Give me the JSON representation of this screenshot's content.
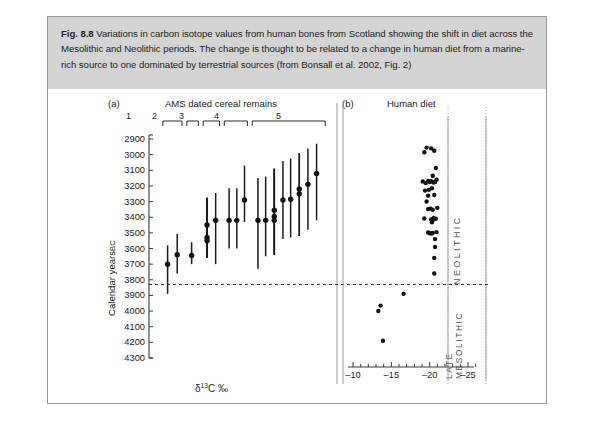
{
  "figure": {
    "number": "Fig. 8.8",
    "caption": "Variations in carbon isotope values from human bones from Scotland showing the shift in diet across the Mesolithic and Neolithic periods. The change is thought to be related to a change in human diet from a marine-rich source to one dominated by terrestrial sources (from Bonsall et al. 2002, Fig. 2)",
    "caption_background": "#d4d4d4",
    "border_color": "#9a9a9a"
  },
  "panel_a": {
    "tag": "(a)",
    "title": "AMS dated cereal remains",
    "group_labels": [
      "1",
      "2",
      "3",
      "4",
      "5"
    ]
  },
  "panel_b": {
    "tag": "(b)",
    "title": "Human diet",
    "period_upper": "NEOLITHIC",
    "period_lower_line1": "LATE",
    "period_lower_line2": "MESOLITHIC"
  },
  "axes": {
    "y_label": "Calendar years",
    "y_label_suffix": "BC",
    "y_ticks": [
      2900,
      3000,
      3100,
      3200,
      3300,
      3400,
      3500,
      3600,
      3700,
      3800,
      3900,
      4000,
      4100,
      4200,
      4300
    ],
    "y_min": 2900,
    "y_max": 4300,
    "x_label_html": "δ<sup>13</sup>C ‰",
    "x_label_plain": "δ13C ‰",
    "x_major_ticks": [
      -10,
      -15,
      -20,
      -25
    ],
    "x_min": -9,
    "x_max": -26,
    "boundary_value": 3830,
    "boundary_style": "dashed"
  },
  "chart_data": {
    "type": "scatter",
    "title": "Variations in carbon isotope values from human bones from Scotland",
    "panels": [
      {
        "id": "a",
        "type": "errorbar",
        "title": "AMS dated cereal remains",
        "xlabel": "",
        "ylabel": "Calendar years BC",
        "ylim": [
          4300,
          2900
        ],
        "grid": false,
        "groups": [
          {
            "label": "1",
            "x_start": 0.5,
            "x_end": 2.5
          },
          {
            "label": "2",
            "x_start": 3.0,
            "x_end": 4.2
          },
          {
            "label": "3",
            "x_start": 4.7,
            "x_end": 6.4
          },
          {
            "label": "4",
            "x_start": 6.9,
            "x_end": 9.3
          },
          {
            "label": "5",
            "x_start": 9.8,
            "x_end": 17.4
          }
        ],
        "points": [
          {
            "group": "1",
            "x": 1.0,
            "value": 3700,
            "low": 3890,
            "high": 3580
          },
          {
            "group": "1",
            "x": 2.0,
            "value": 3640,
            "low": 3760,
            "high": 3505
          },
          {
            "group": "2",
            "x": 3.5,
            "value": 3645,
            "low": 3700,
            "high": 3560
          },
          {
            "group": "3",
            "x": 5.1,
            "value": 3450,
            "low": 3660,
            "high": 3275
          },
          {
            "group": "3",
            "x": 5.1,
            "value": 3530,
            "low": 3660,
            "high": 3275
          },
          {
            "group": "3",
            "x": 5.1,
            "value": 3550,
            "low": 3660,
            "high": 3275
          },
          {
            "group": "3",
            "x": 6.0,
            "value": 3420,
            "low": 3700,
            "high": 3245
          },
          {
            "group": "4",
            "x": 7.4,
            "value": 3420,
            "low": 3600,
            "high": 3215
          },
          {
            "group": "4",
            "x": 8.2,
            "value": 3420,
            "low": 3600,
            "high": 3215
          },
          {
            "group": "4",
            "x": 9.0,
            "value": 3290,
            "low": 3430,
            "high": 3070
          },
          {
            "group": "5",
            "x": 10.4,
            "value": 3420,
            "low": 3730,
            "high": 3150
          },
          {
            "group": "5",
            "x": 11.2,
            "value": 3420,
            "low": 3650,
            "high": 3140
          },
          {
            "group": "5",
            "x": 12.1,
            "value": 3355,
            "low": 3640,
            "high": 3090
          },
          {
            "group": "5",
            "x": 12.1,
            "value": 3395,
            "low": 3640,
            "high": 3090
          },
          {
            "group": "5",
            "x": 12.1,
            "value": 3420,
            "low": 3640,
            "high": 3090
          },
          {
            "group": "5",
            "x": 13.0,
            "value": 3290,
            "low": 3540,
            "high": 3040
          },
          {
            "group": "5",
            "x": 13.8,
            "value": 3285,
            "low": 3530,
            "high": 3025
          },
          {
            "group": "5",
            "x": 14.7,
            "value": 3220,
            "low": 3520,
            "high": 2990
          },
          {
            "group": "5",
            "x": 14.7,
            "value": 3250,
            "low": 3520,
            "high": 2990
          },
          {
            "group": "5",
            "x": 15.6,
            "value": 3190,
            "low": 3480,
            "high": 2960
          },
          {
            "group": "5",
            "x": 16.5,
            "value": 3120,
            "low": 3420,
            "high": 2930
          }
        ]
      },
      {
        "id": "b",
        "type": "scatter",
        "title": "Human diet",
        "xlabel": "δ13C ‰",
        "ylabel": "Calendar years BC",
        "xlim": [
          -9,
          -26
        ],
        "ylim": [
          4300,
          2900
        ],
        "grid": false,
        "points": [
          {
            "d13c": -20.2,
            "year": 2960
          },
          {
            "d13c": -20.6,
            "year": 2975
          },
          {
            "d13c": -19.6,
            "year": 2955
          },
          {
            "d13c": -19.3,
            "year": 2985
          },
          {
            "d13c": -20.8,
            "year": 3085
          },
          {
            "d13c": -20.4,
            "year": 3135
          },
          {
            "d13c": -20.9,
            "year": 3160
          },
          {
            "d13c": -20.7,
            "year": 3175
          },
          {
            "d13c": -20.5,
            "year": 3178
          },
          {
            "d13c": -20.2,
            "year": 3170
          },
          {
            "d13c": -20.0,
            "year": 3175
          },
          {
            "d13c": -19.8,
            "year": 3168
          },
          {
            "d13c": -19.5,
            "year": 3182
          },
          {
            "d13c": -19.1,
            "year": 3172
          },
          {
            "d13c": -20.3,
            "year": 3215
          },
          {
            "d13c": -19.9,
            "year": 3225
          },
          {
            "d13c": -19.4,
            "year": 3230
          },
          {
            "d13c": -20.6,
            "year": 3258
          },
          {
            "d13c": -19.8,
            "year": 3262
          },
          {
            "d13c": -19.6,
            "year": 3300
          },
          {
            "d13c": -21.0,
            "year": 3340
          },
          {
            "d13c": -20.4,
            "year": 3352
          },
          {
            "d13c": -20.1,
            "year": 3345
          },
          {
            "d13c": -19.8,
            "year": 3348
          },
          {
            "d13c": -20.8,
            "year": 3410
          },
          {
            "d13c": -20.5,
            "year": 3405
          },
          {
            "d13c": -20.4,
            "year": 3420
          },
          {
            "d13c": -20.3,
            "year": 3432
          },
          {
            "d13c": -20.2,
            "year": 3415
          },
          {
            "d13c": -19.3,
            "year": 3408
          },
          {
            "d13c": -20.9,
            "year": 3495
          },
          {
            "d13c": -20.4,
            "year": 3500
          },
          {
            "d13c": -20.2,
            "year": 3505
          },
          {
            "d13c": -20.0,
            "year": 3502
          },
          {
            "d13c": -19.8,
            "year": 3498
          },
          {
            "d13c": -20.7,
            "year": 3540
          },
          {
            "d13c": -20.7,
            "year": 3590
          },
          {
            "d13c": -20.6,
            "year": 3660
          },
          {
            "d13c": -20.6,
            "year": 3760
          },
          {
            "d13c": -16.6,
            "year": 3890
          },
          {
            "d13c": -13.6,
            "year": 3965
          },
          {
            "d13c": -13.3,
            "year": 4000
          },
          {
            "d13c": -13.9,
            "year": 4190
          }
        ]
      }
    ]
  }
}
